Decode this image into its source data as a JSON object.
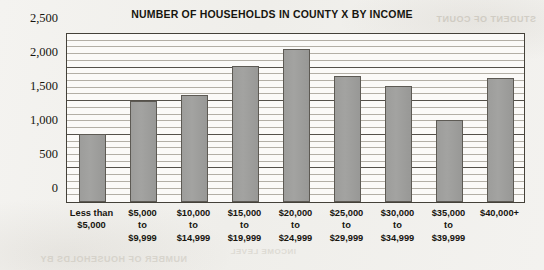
{
  "chart_data": {
    "type": "bar",
    "title": "NUMBER OF HOUSEHOLDS IN COUNTY X BY INCOME",
    "xlabel": "",
    "ylabel": "",
    "ylim": [
      0,
      2500
    ],
    "y_major_step": 500,
    "y_minor_step": 100,
    "grid": true,
    "legend": "none",
    "bar_color": "#9d9d9b",
    "bar_border_color": "#5d5a54",
    "categories": [
      "Less than $5,000",
      "$5,000 to $9,999",
      "$10,000 to $14,999",
      "$15,000 to $19,999",
      "$20,000 to $24,999",
      "$25,000 to $29,999",
      "$30,000 to $34,999",
      "$35,000 to $39,999",
      "$40,000+"
    ],
    "category_lines": [
      [
        "Less than",
        "$5,000"
      ],
      [
        "$5,000",
        "to",
        "$9,999"
      ],
      [
        "$10,000",
        "to",
        "$14,999"
      ],
      [
        "$15,000",
        "to",
        "$19,999"
      ],
      [
        "$20,000",
        "to",
        "$24,999"
      ],
      [
        "$25,000",
        "to",
        "$29,999"
      ],
      [
        "$30,000",
        "to",
        "$34,999"
      ],
      [
        "$35,000",
        "to",
        "$39,999"
      ],
      [
        "$40,000+"
      ]
    ],
    "values": [
      1000,
      1480,
      1570,
      2000,
      2250,
      1850,
      1700,
      1210,
      1820
    ],
    "y_tick_labels": [
      "0",
      "500",
      "1,000",
      "1,500",
      "2,000",
      "2,500"
    ],
    "y_tick_values": [
      0,
      500,
      1000,
      1500,
      2000,
      2500
    ]
  },
  "artifacts": {
    "bleed_top_right": "STUDENT OF COUNT",
    "bleed_bottom_left": "NUMBER OF HOUSEHOLDS BY",
    "bleed_bottom_mid": "INCOME LEVEL"
  }
}
